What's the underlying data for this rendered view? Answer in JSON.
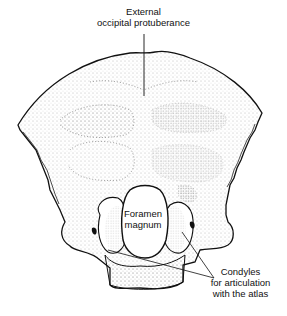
{
  "diagram": {
    "labels": {
      "external_occipital_protuberance": [
        "External",
        "occipital protuberance"
      ],
      "foramen_magnum": [
        "Foramen",
        "magnum"
      ],
      "condyles": [
        "Condyles",
        "for articulation",
        "with the atlas"
      ]
    },
    "colors": {
      "outline": "#111111",
      "stipple": "#555555",
      "background": "#ffffff"
    }
  }
}
